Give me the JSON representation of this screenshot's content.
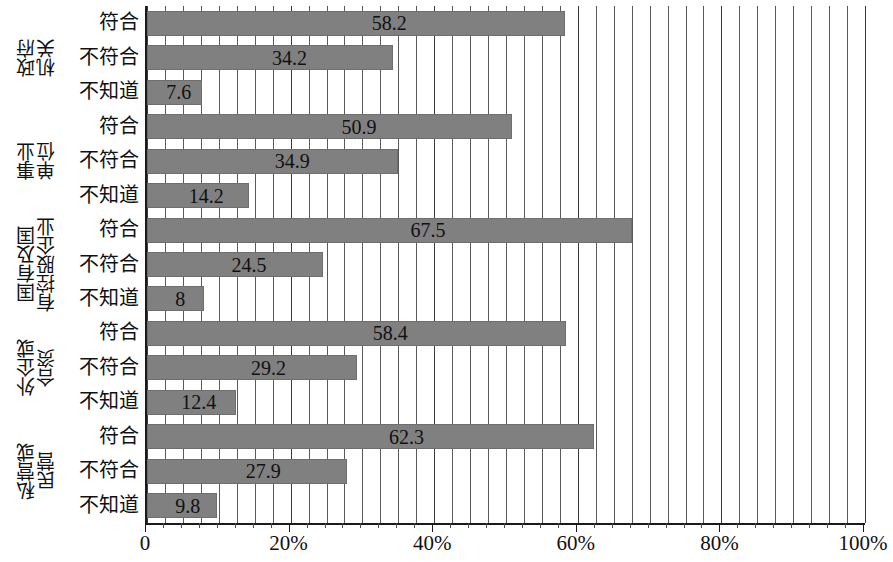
{
  "chart_data": {
    "type": "bar",
    "orientation": "horizontal",
    "title": "",
    "xlabel": "",
    "ylabel": "",
    "xlim": [
      0,
      100
    ],
    "xticks": [
      0,
      20,
      40,
      60,
      80,
      100
    ],
    "xtick_labels": [
      "0",
      "20%",
      "40%",
      "60%",
      "80%",
      "100%"
    ],
    "grid": true,
    "grid_interval": 2.5,
    "legend": "none",
    "bar_color": "#808080",
    "response_categories": [
      "符合",
      "不符合",
      "不知道"
    ],
    "groups": [
      {
        "label": "政府机关",
        "label_lines": [
          "政府",
          "机关"
        ],
        "values": [
          58.2,
          34.2,
          7.6
        ],
        "value_labels": [
          "58.2",
          "34.2",
          "7.6"
        ]
      },
      {
        "label": "事业单位",
        "label_lines": [
          "事业",
          "单位"
        ],
        "values": [
          50.9,
          34.9,
          14.2
        ],
        "value_labels": [
          "50.9",
          "34.9",
          "14.2"
        ]
      },
      {
        "label": "国有及国有控股企业",
        "label_lines": [
          "国有及国",
          "有控股企业"
        ],
        "values": [
          67.5,
          24.5,
          8
        ],
        "value_labels": [
          "67.5",
          "24.5",
          "8"
        ]
      },
      {
        "label": "外企或合资企业",
        "label_lines": [
          "外企或",
          "合资"
        ],
        "values": [
          58.4,
          29.2,
          12.4
        ],
        "value_labels": [
          "58.4",
          "29.2",
          "12.4"
        ]
      },
      {
        "label": "私营或民营",
        "label_lines": [
          "私营或",
          "民营"
        ],
        "values": [
          62.3,
          27.9,
          9.8
        ],
        "value_labels": [
          "62.3",
          "27.9",
          "9.8"
        ]
      }
    ]
  }
}
